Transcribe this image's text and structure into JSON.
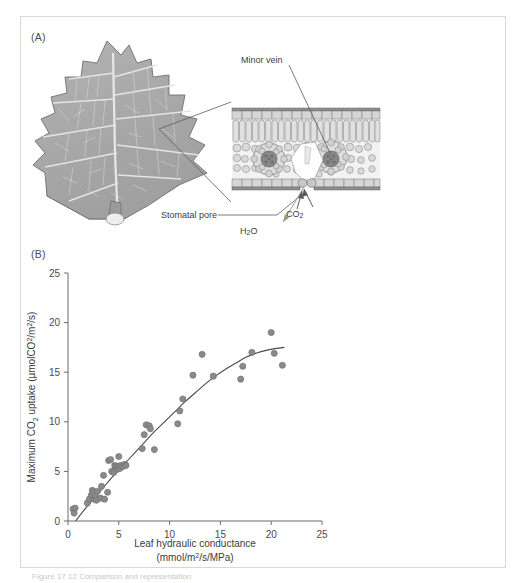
{
  "figure": {
    "panel_a_letter": "(A)",
    "panel_b_letter": "(B)",
    "caption_partial": "Figure 17.12  Comparison and representation"
  },
  "panel_a": {
    "labels": {
      "minor_vein": "Minor vein",
      "stomatal_pore": "Stomatal pore",
      "water": "H2O",
      "water_base": "H",
      "water_sub": "2",
      "water_tail": "O",
      "carbon_dioxide": "CO2",
      "co2_base": "CO",
      "co2_sub": "2"
    },
    "illustration": {
      "leaf_name": "lobed-leaf-diagram",
      "cross_section_name": "leaf-cross-section-diagram",
      "leaf_fill": "#a8a8a8",
      "leaf_shadow": "#8f8f8f",
      "vein_color": "#e2e2e2",
      "tissue_fill": "#d0d0d0",
      "outline_color": "#6a6a6a"
    }
  },
  "chart_data": {
    "type": "scatter",
    "title": "",
    "xlabel_line1": "Leaf hydraulic conductance",
    "xlabel_line2": "(mmol/m2/s/MPa)",
    "xlabel_line2_parts": {
      "pre": "(mmol/m",
      "sup": "2",
      "post": "/s/MPa)"
    },
    "ylabel_parts": {
      "pre": "Maximum CO",
      "sub1": "2",
      "mid": " uptake (µmolCO",
      "sup1": "2",
      "mid2": "/m",
      "sup2": "2",
      "post": "/s)"
    },
    "ylabel": "Maximum CO2 uptake (µmolCO2/m2/s)",
    "xlim": [
      0,
      25
    ],
    "ylim": [
      0,
      25
    ],
    "xticks": [
      0,
      5,
      10,
      15,
      20,
      25
    ],
    "yticks": [
      0,
      5,
      10,
      15,
      20,
      25
    ],
    "grid": false,
    "legend": "none",
    "marker_color": "#8a8a8a",
    "marker_edge_color": "#6d6d6d",
    "curve_color": "#4a4a4a",
    "points": [
      [
        0.5,
        1.2
      ],
      [
        0.6,
        0.8
      ],
      [
        0.7,
        1.3
      ],
      [
        1.9,
        1.8
      ],
      [
        2.1,
        2.2
      ],
      [
        2.3,
        2.6
      ],
      [
        2.4,
        3.1
      ],
      [
        2.5,
        2.9
      ],
      [
        2.6,
        2.2
      ],
      [
        2.7,
        2.5
      ],
      [
        2.8,
        2.1
      ],
      [
        2.9,
        3.0
      ],
      [
        3.2,
        2.3
      ],
      [
        3.3,
        3.5
      ],
      [
        3.5,
        4.6
      ],
      [
        3.6,
        2.2
      ],
      [
        3.9,
        2.9
      ],
      [
        4.0,
        6.1
      ],
      [
        4.2,
        6.2
      ],
      [
        4.3,
        5.0
      ],
      [
        4.5,
        4.9
      ],
      [
        4.6,
        5.6
      ],
      [
        4.7,
        5.4
      ],
      [
        4.8,
        5.2
      ],
      [
        4.9,
        5.5
      ],
      [
        5.0,
        6.5
      ],
      [
        5.1,
        5.3
      ],
      [
        5.2,
        5.6
      ],
      [
        5.4,
        5.5
      ],
      [
        5.6,
        5.7
      ],
      [
        5.7,
        5.6
      ],
      [
        7.3,
        7.3
      ],
      [
        7.5,
        8.7
      ],
      [
        7.7,
        9.7
      ],
      [
        8.0,
        9.6
      ],
      [
        8.1,
        9.3
      ],
      [
        8.5,
        7.2
      ],
      [
        10.8,
        9.8
      ],
      [
        11.0,
        11.1
      ],
      [
        11.3,
        12.3
      ],
      [
        12.3,
        14.7
      ],
      [
        13.2,
        16.8
      ],
      [
        14.3,
        14.6
      ],
      [
        17.0,
        14.3
      ],
      [
        17.2,
        15.6
      ],
      [
        18.1,
        17.0
      ],
      [
        20.0,
        19.0
      ],
      [
        20.3,
        16.9
      ],
      [
        21.1,
        15.7
      ]
    ],
    "fit_curve": {
      "description": "saturating-fit-line",
      "points": [
        [
          0.75,
          0.0
        ],
        [
          1.5,
          1.0
        ],
        [
          2.5,
          2.2
        ],
        [
          3.5,
          3.4
        ],
        [
          4.5,
          4.6
        ],
        [
          5.5,
          5.7
        ],
        [
          6.5,
          6.8
        ],
        [
          7.5,
          7.9
        ],
        [
          8.5,
          9.0
        ],
        [
          9.5,
          10.0
        ],
        [
          10.5,
          11.0
        ],
        [
          11.5,
          12.0
        ],
        [
          12.5,
          12.9
        ],
        [
          13.5,
          13.8
        ],
        [
          14.5,
          14.6
        ],
        [
          15.5,
          15.3
        ],
        [
          16.5,
          15.9
        ],
        [
          17.5,
          16.5
        ],
        [
          18.5,
          16.9
        ],
        [
          19.5,
          17.2
        ],
        [
          20.5,
          17.4
        ],
        [
          21.3,
          17.5
        ]
      ]
    }
  }
}
